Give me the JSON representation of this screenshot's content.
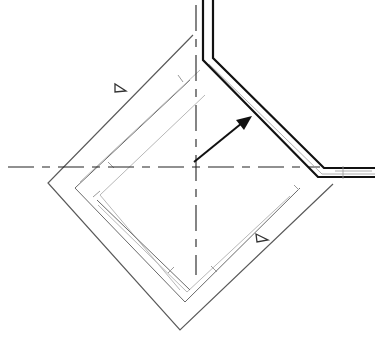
{
  "diagram": {
    "type": "technical plan drawing",
    "colors": {
      "background": "#ffffff",
      "line_dark": "#111111",
      "line_mid": "#5a5a5a",
      "line_light": "#b8b8b8"
    },
    "markers": [
      {
        "name": "triangle-marker-upper-left",
        "shape": "triangle"
      },
      {
        "name": "triangle-marker-lower-right",
        "shape": "triangle"
      }
    ],
    "elements": [
      "outer-diamond",
      "inner-diamond-outline",
      "horizontal-centerline",
      "vertical-centerline",
      "double-line-wall",
      "direction-arrow"
    ]
  }
}
